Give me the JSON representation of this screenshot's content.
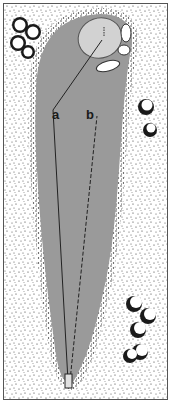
{
  "diagram": {
    "type": "golf-hole-illustration",
    "labels": {
      "a": "a",
      "b": "b"
    },
    "colors": {
      "background": "#ffffff",
      "fairway": "#9a9a9a",
      "green": "#d2d2d2",
      "rough_stipple": "#2a2a2a",
      "trees": "#1a1a1a",
      "border": "#555555"
    }
  }
}
